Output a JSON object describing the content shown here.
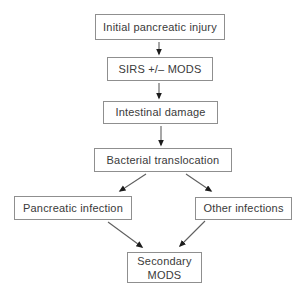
{
  "figure": {
    "type": "flowchart",
    "background": "#ffffff",
    "nodes": [
      {
        "id": "initial_injury",
        "label": "Initial pancreatic injury"
      },
      {
        "id": "sirs_mods",
        "label": "SIRS +/– MODS"
      },
      {
        "id": "intestinal_damage",
        "label": "Intestinal damage"
      },
      {
        "id": "bacterial_translocation",
        "label": "Bacterial translocation"
      },
      {
        "id": "pancreatic_infection",
        "label": "Pancreatic infection"
      },
      {
        "id": "other_infections",
        "label": "Other infections"
      },
      {
        "id": "secondary_mods",
        "label": "Secondary MODS"
      }
    ],
    "edges": [
      {
        "from": "initial_injury",
        "to": "sirs_mods"
      },
      {
        "from": "sirs_mods",
        "to": "intestinal_damage"
      },
      {
        "from": "intestinal_damage",
        "to": "bacterial_translocation"
      },
      {
        "from": "bacterial_translocation",
        "to": "pancreatic_infection"
      },
      {
        "from": "bacterial_translocation",
        "to": "other_infections"
      },
      {
        "from": "pancreatic_infection",
        "to": "secondary_mods"
      },
      {
        "from": "other_infections",
        "to": "secondary_mods"
      }
    ],
    "colors": {
      "box_border": "#8f8f8f",
      "text": "#3a3a3a",
      "arrow_line": "#5f5f5f",
      "arrow_head": "#1c1c1c",
      "background": "#ffffff"
    }
  }
}
